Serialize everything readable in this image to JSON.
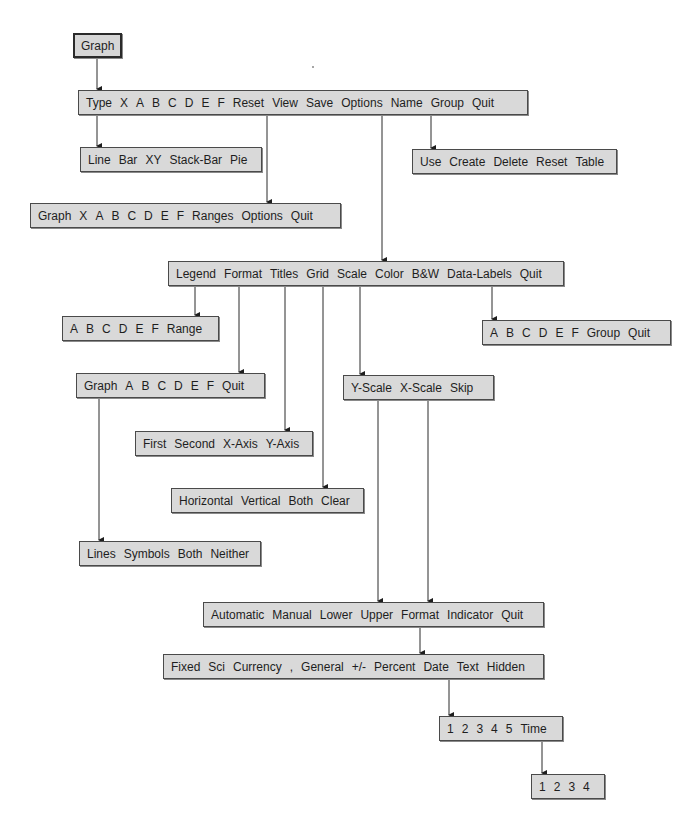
{
  "diagram": {
    "colors": {
      "box_fill": "#d9d9d9",
      "box_border": "#4a4a4a",
      "line": "#2a2a2a",
      "text": "#1e1e1e"
    },
    "menus": {
      "root": {
        "items": [
          "Graph"
        ]
      },
      "graph": {
        "items": [
          "Type",
          "X",
          "A",
          "B",
          "C",
          "D",
          "E",
          "F",
          "Reset",
          "View",
          "Save",
          "Options",
          "Name",
          "Group",
          "Quit"
        ]
      },
      "type": {
        "items": [
          "Line",
          "Bar",
          "XY",
          "Stack-Bar",
          "Pie"
        ]
      },
      "name": {
        "items": [
          "Use",
          "Create",
          "Delete",
          "Reset",
          "Table"
        ]
      },
      "reset": {
        "items": [
          "Graph",
          "X",
          "A",
          "B",
          "C",
          "D",
          "E",
          "F",
          "Ranges",
          "Options",
          "Quit"
        ]
      },
      "options": {
        "items": [
          "Legend",
          "Format",
          "Titles",
          "Grid",
          "Scale",
          "Color",
          "B&W",
          "Data-Labels",
          "Quit"
        ]
      },
      "legend": {
        "items": [
          "A",
          "B",
          "C",
          "D",
          "E",
          "F",
          "Range"
        ]
      },
      "data_labels": {
        "items": [
          "A",
          "B",
          "C",
          "D",
          "E",
          "F",
          "Group",
          "Quit"
        ]
      },
      "format": {
        "items": [
          "Graph",
          "A",
          "B",
          "C",
          "D",
          "E",
          "F",
          "Quit"
        ]
      },
      "scale": {
        "items": [
          "Y-Scale",
          "X-Scale",
          "Skip"
        ]
      },
      "titles": {
        "items": [
          "First",
          "Second",
          "X-Axis",
          "Y-Axis"
        ]
      },
      "grid": {
        "items": [
          "Horizontal",
          "Vertical",
          "Both",
          "Clear"
        ]
      },
      "format_graph": {
        "items": [
          "Lines",
          "Symbols",
          "Both",
          "Neither"
        ]
      },
      "axis_scale": {
        "items": [
          "Automatic",
          "Manual",
          "Lower",
          "Upper",
          "Format",
          "Indicator",
          "Quit"
        ]
      },
      "num_format": {
        "items": [
          "Fixed",
          "Sci",
          "Currency",
          ",",
          "General",
          "+/-",
          "Percent",
          "Date",
          "Text",
          "Hidden"
        ]
      },
      "date": {
        "items": [
          "1",
          "2",
          "3",
          "4",
          "5",
          "Time"
        ]
      },
      "time": {
        "items": [
          "1",
          "2",
          "3",
          "4"
        ]
      }
    }
  }
}
